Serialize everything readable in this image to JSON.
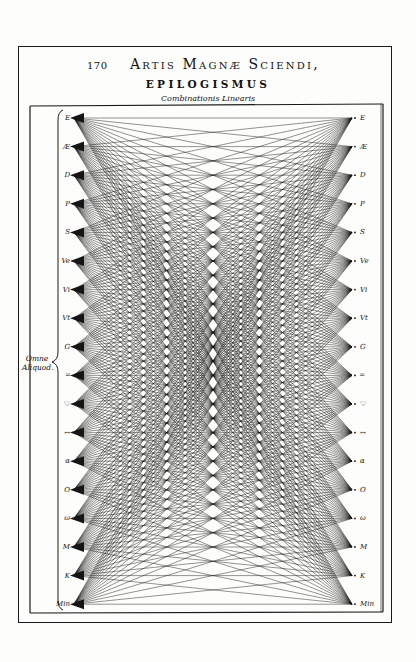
{
  "header": {
    "page_number": "170",
    "running_title": "Artis Magnæ Sciendi,",
    "section_title": "EPILOGISMUS",
    "subtitle": "Combinationis Linearis"
  },
  "diagram": {
    "brace_label_line1": "Omne",
    "brace_label_line2": "Aliquod.",
    "ink_color": "#151515",
    "paper_color": "#fdfdfb",
    "left_nodes": [
      {
        "label": "E"
      },
      {
        "label": "Æ"
      },
      {
        "label": "D"
      },
      {
        "label": "P"
      },
      {
        "label": "S"
      },
      {
        "label": "Ve"
      },
      {
        "label": "Vi"
      },
      {
        "label": "Vt"
      },
      {
        "label": "G"
      },
      {
        "label": "═"
      },
      {
        "label": "♡"
      },
      {
        "label": "↔"
      },
      {
        "label": "α"
      },
      {
        "label": "O"
      },
      {
        "label": "ω"
      },
      {
        "label": "M"
      },
      {
        "label": "K"
      },
      {
        "label": "Min"
      }
    ],
    "right_nodes": [
      {
        "label": "E"
      },
      {
        "label": "Æ"
      },
      {
        "label": "D"
      },
      {
        "label": "P"
      },
      {
        "label": "S"
      },
      {
        "label": "Ve"
      },
      {
        "label": "Vi"
      },
      {
        "label": "Vt"
      },
      {
        "label": "G"
      },
      {
        "label": "═"
      },
      {
        "label": "♡"
      },
      {
        "label": "↔"
      },
      {
        "label": "α"
      },
      {
        "label": "O"
      },
      {
        "label": "ω"
      },
      {
        "label": "M"
      },
      {
        "label": "K"
      },
      {
        "label": "Min"
      }
    ]
  }
}
